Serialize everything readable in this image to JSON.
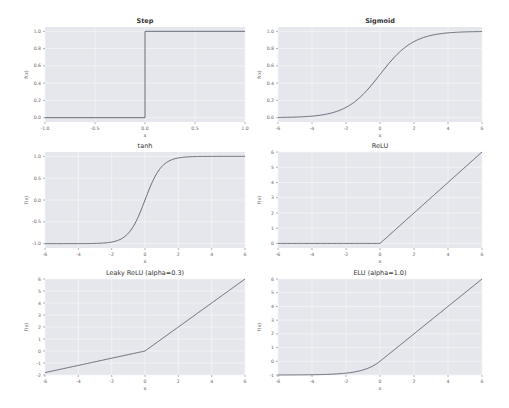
{
  "figure": {
    "background": "#ffffff",
    "axes_facecolor": "#e6e7ec",
    "grid_color": "#f4f5f7",
    "line_color": "#555b66",
    "text_color": "#333333",
    "tick_color": "#666666"
  },
  "chart_data": [
    {
      "type": "line",
      "title": "Step",
      "xlabel": "x",
      "ylabel": "f(x)",
      "xlim": [
        -1.0,
        1.0
      ],
      "ylim": [
        -0.05,
        1.05
      ],
      "xticks": [
        -1.0,
        -0.5,
        0.0,
        0.5,
        1.0
      ],
      "xticklabels": [
        "-1.0",
        "-0.5",
        "0.0",
        "0.5",
        "1.0"
      ],
      "yticks": [
        0.0,
        0.2,
        0.4,
        0.6,
        0.8,
        1.0
      ],
      "yticklabels": [
        "0.0",
        "0.2",
        "0.4",
        "0.6",
        "0.8",
        "1.0"
      ],
      "grid": true,
      "function": "step",
      "x": [
        -1.0,
        0.0,
        0.0,
        1.0
      ],
      "y": [
        0.0,
        0.0,
        1.0,
        1.0
      ]
    },
    {
      "type": "line",
      "title": "Sigmoid",
      "xlabel": "x",
      "ylabel": "f(x)",
      "xlim": [
        -6,
        6
      ],
      "ylim": [
        -0.05,
        1.05
      ],
      "xticks": [
        -6,
        -4,
        -2,
        0,
        2,
        4,
        6
      ],
      "xticklabels": [
        "-6",
        "-4",
        "-2",
        "0",
        "2",
        "4",
        "6"
      ],
      "yticks": [
        0.0,
        0.2,
        0.4,
        0.6,
        0.8,
        1.0
      ],
      "yticklabels": [
        "0.0",
        "0.2",
        "0.4",
        "0.6",
        "0.8",
        "1.0"
      ],
      "grid": true,
      "function": "sigmoid",
      "x": [
        -6,
        -4,
        -2,
        -1,
        0,
        1,
        2,
        4,
        6
      ],
      "y": [
        0.0025,
        0.018,
        0.119,
        0.269,
        0.5,
        0.731,
        0.881,
        0.982,
        0.9975
      ]
    },
    {
      "type": "line",
      "title": "tanh",
      "xlabel": "x",
      "ylabel": "f(x)",
      "xlim": [
        -6,
        6
      ],
      "ylim": [
        -1.1,
        1.1
      ],
      "xticks": [
        -6,
        -4,
        -2,
        0,
        2,
        4,
        6
      ],
      "xticklabels": [
        "-6",
        "-4",
        "-2",
        "0",
        "2",
        "4",
        "6"
      ],
      "yticks": [
        -1.0,
        -0.5,
        0.0,
        0.5,
        1.0
      ],
      "yticklabels": [
        "-1.0",
        "-0.5",
        "0.0",
        "0.5",
        "1.0"
      ],
      "grid": true,
      "function": "tanh",
      "x": [
        -6,
        -4,
        -2,
        -1,
        0,
        1,
        2,
        4,
        6
      ],
      "y": [
        -1.0,
        -0.999,
        -0.964,
        -0.762,
        0.0,
        0.762,
        0.964,
        0.999,
        1.0
      ]
    },
    {
      "type": "line",
      "title": "ReLU",
      "xlabel": "x",
      "ylabel": "f(x)",
      "xlim": [
        -6,
        6
      ],
      "ylim": [
        -0.3,
        6.0
      ],
      "xticks": [
        -6,
        -4,
        -2,
        0,
        2,
        4,
        6
      ],
      "xticklabels": [
        "-6",
        "-4",
        "-2",
        "0",
        "2",
        "4",
        "6"
      ],
      "yticks": [
        0,
        1,
        2,
        3,
        4,
        5,
        6
      ],
      "yticklabels": [
        "0",
        "1",
        "2",
        "3",
        "4",
        "5",
        "6"
      ],
      "grid": true,
      "function": "relu",
      "x": [
        -6,
        0,
        6
      ],
      "y": [
        0,
        0,
        6
      ]
    },
    {
      "type": "line",
      "title": "Leaky ReLU (alpha=0.3)",
      "xlabel": "x",
      "ylabel": "f(x)",
      "xlim": [
        -6,
        6
      ],
      "ylim": [
        -2.0,
        6.0
      ],
      "xticks": [
        -6,
        -4,
        -2,
        0,
        2,
        4,
        6
      ],
      "xticklabels": [
        "-6",
        "-4",
        "-2",
        "0",
        "2",
        "4",
        "6"
      ],
      "yticks": [
        -2,
        -1,
        0,
        1,
        2,
        3,
        4,
        5,
        6
      ],
      "yticklabels": [
        "-2",
        "-1",
        "0",
        "1",
        "2",
        "3",
        "4",
        "5",
        "6"
      ],
      "grid": true,
      "function": "leaky_relu",
      "alpha": 0.3,
      "x": [
        -6,
        0,
        6
      ],
      "y": [
        -1.8,
        0,
        6
      ]
    },
    {
      "type": "line",
      "title": "ELU (alpha=1.0)",
      "xlabel": "x",
      "ylabel": "f(x)",
      "xlim": [
        -6,
        6
      ],
      "ylim": [
        -1.0,
        6.0
      ],
      "xticks": [
        -6,
        -4,
        -2,
        0,
        2,
        4,
        6
      ],
      "xticklabels": [
        "-6",
        "-4",
        "-2",
        "0",
        "2",
        "4",
        "6"
      ],
      "yticks": [
        -1,
        0,
        1,
        2,
        3,
        4,
        5,
        6
      ],
      "yticklabels": [
        "-1",
        "0",
        "1",
        "2",
        "3",
        "4",
        "5",
        "6"
      ],
      "grid": true,
      "function": "elu",
      "alpha": 1.0,
      "x": [
        -6,
        -4,
        -2,
        -1,
        0,
        2,
        4,
        6
      ],
      "y": [
        -0.998,
        -0.982,
        -0.865,
        -0.632,
        0,
        2,
        4,
        6
      ]
    }
  ],
  "layout": {
    "axes_boxes": [
      {
        "x": 45,
        "y": 27,
        "w": 200,
        "h": 95
      },
      {
        "x": 278,
        "y": 27,
        "w": 204,
        "h": 95
      },
      {
        "x": 45,
        "y": 152,
        "w": 200,
        "h": 96
      },
      {
        "x": 278,
        "y": 152,
        "w": 204,
        "h": 96
      },
      {
        "x": 45,
        "y": 279,
        "w": 200,
        "h": 96
      },
      {
        "x": 278,
        "y": 279,
        "w": 204,
        "h": 96
      }
    ]
  }
}
